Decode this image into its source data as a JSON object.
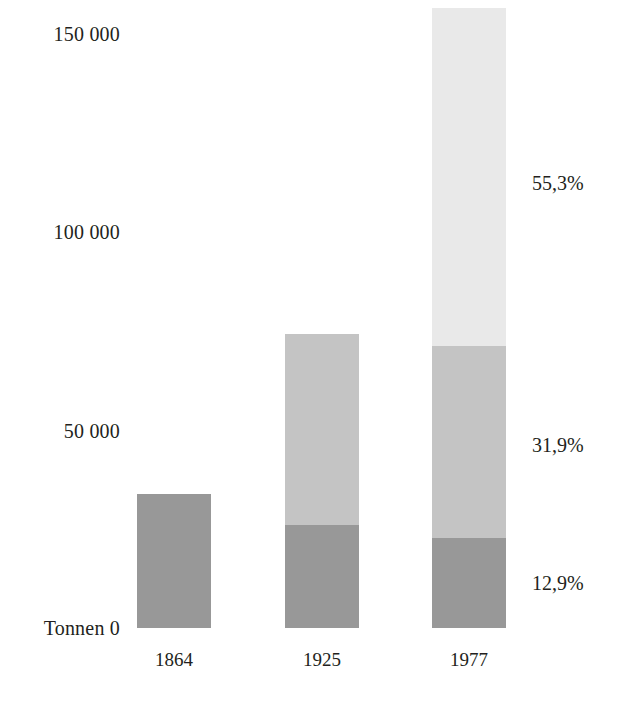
{
  "chart_data": {
    "type": "bar",
    "subtype": "stacked-vertical",
    "title": "",
    "xlabel": "",
    "ylabel": "Tonnen",
    "ylim": [
      0,
      158000
    ],
    "grid": false,
    "legend": "none",
    "value_unit": "Tonnen",
    "decimal_separator": ",",
    "thousands_separator": " ",
    "categories": [
      "1864",
      "1925",
      "1977"
    ],
    "y_axis": {
      "label": "Tonnen",
      "baseline_label": "Tonnen 0",
      "zero_label": "0",
      "ticks": [
        {
          "value": 0,
          "label": "0"
        },
        {
          "value": 50000,
          "label": "50 000"
        },
        {
          "value": 100000,
          "label": "100 000"
        },
        {
          "value": 150000,
          "label": "150 000"
        }
      ]
    },
    "series": [
      {
        "name": "segment-bottom",
        "color": "#989898",
        "values": [
          33800,
          26000,
          22700
        ]
      },
      {
        "name": "segment-middle",
        "color": "#c4c4c4",
        "values": [
          0,
          48000,
          48400
        ]
      },
      {
        "name": "segment-top",
        "color": "#e9e9e9",
        "values": [
          0,
          0,
          85100
        ]
      }
    ],
    "totals": [
      33800,
      74000,
      156200
    ],
    "annotations": [
      {
        "text": "55,3%",
        "segment": "segment-top",
        "category": "1977",
        "value_percent": 55.3
      },
      {
        "text": "31,9%",
        "segment": "segment-middle",
        "category": "1977",
        "value_percent": 31.9
      },
      {
        "text": "12,9%",
        "segment": "segment-bottom",
        "category": "1977",
        "value_percent": 12.9
      }
    ],
    "colors": {
      "segment_bottom": "#989898",
      "segment_middle": "#c4c4c4",
      "segment_top": "#e9e9e9",
      "text": "#231f20",
      "background": "#ffffff"
    }
  },
  "y_ticks": [
    {
      "label": "150 000",
      "top_px": 24
    },
    {
      "label": "100 000",
      "top_px": 222
    },
    {
      "label": "50 000",
      "top_px": 421
    },
    {
      "label": "Tonnen 0",
      "top_px": 618
    }
  ],
  "bars": [
    {
      "year": "1864",
      "left_px": 137,
      "width_px": 74,
      "segments": [
        {
          "name": "segment-bottom",
          "height_px": 134,
          "color": "#989898"
        }
      ]
    },
    {
      "year": "1925",
      "left_px": 285,
      "width_px": 74,
      "segments": [
        {
          "name": "segment-bottom",
          "height_px": 103,
          "color": "#989898"
        },
        {
          "name": "segment-middle",
          "height_px": 191,
          "color": "#c4c4c4"
        }
      ]
    },
    {
      "year": "1977",
      "left_px": 432,
      "width_px": 74,
      "segments": [
        {
          "name": "segment-bottom",
          "height_px": 90,
          "color": "#989898"
        },
        {
          "name": "segment-middle",
          "height_px": 192,
          "color": "#c4c4c4"
        },
        {
          "name": "segment-top",
          "height_px": 338,
          "color": "#e9e9e9"
        }
      ]
    }
  ],
  "percent_labels": [
    {
      "text": "55,3%",
      "top_px": 173
    },
    {
      "text": "31,9%",
      "top_px": 435
    },
    {
      "text": "12,9%",
      "top_px": 573
    }
  ]
}
